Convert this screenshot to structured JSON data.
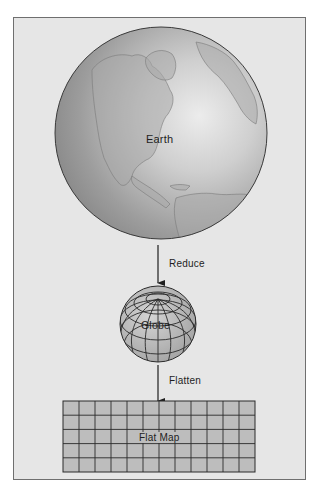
{
  "diagram": {
    "type": "process-flow",
    "stages": [
      {
        "id": "earth",
        "label": "Earth"
      },
      {
        "id": "globe",
        "label": "Globe"
      },
      {
        "id": "flat-map",
        "label": "Flat Map"
      }
    ],
    "transitions": [
      {
        "from": "earth",
        "to": "globe",
        "label": "Reduce"
      },
      {
        "from": "globe",
        "to": "flat-map",
        "label": "Flatten"
      }
    ],
    "flat_map_grid": {
      "columns": 12,
      "rows": 5
    }
  },
  "colors": {
    "background": "#e6e6e6",
    "frame_border": "#6f6f6f",
    "earth_shade_dark": "#8a8a8a",
    "earth_shade_light": "#e4e4e4",
    "grid_fill": "#bdbdbd",
    "line": "#2a2a2a"
  }
}
